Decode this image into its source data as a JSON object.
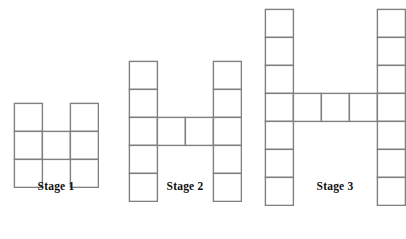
{
  "figure": {
    "title": "",
    "background_color": "#ffffff",
    "line_color": "#808080",
    "line_width": 1.4,
    "cell_size": 28,
    "baseline_y": 175,
    "label_color": "#101010"
  },
  "stages": [
    {
      "label": "Stage 1",
      "stage_number": 1,
      "column_height": 3,
      "middle_cells": 1,
      "middle_row_index": 1,
      "total_squares": 7,
      "left_x": 14,
      "top_y": 103,
      "gap_columns": 1,
      "label_y": 180
    },
    {
      "label": "Stage 2",
      "stage_number": 2,
      "column_height": 5,
      "middle_cells": 2,
      "middle_row_index": 2,
      "total_squares": 12,
      "left_x": 129,
      "top_y": 61,
      "gap_columns": 2,
      "label_y": 180
    },
    {
      "label": "Stage 3",
      "stage_number": 3,
      "column_height": 7,
      "middle_cells": 3,
      "middle_row_index": 3,
      "total_squares": 17,
      "left_x": 265,
      "top_y": 9,
      "gap_columns": 3,
      "label_y": 180
    }
  ]
}
